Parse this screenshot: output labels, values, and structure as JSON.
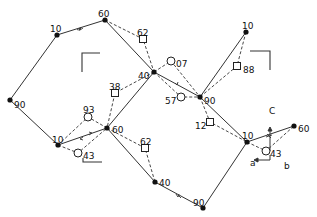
{
  "diagram": {
    "title": "",
    "nodes": [
      {
        "id": "n1",
        "label": "90",
        "x": 10,
        "y": 100,
        "lx": 14,
        "ly": 105
      },
      {
        "id": "n2",
        "label": "10",
        "x": 57,
        "y": 35,
        "lx": 50,
        "ly": 29
      },
      {
        "id": "n3",
        "label": "60",
        "x": 105,
        "y": 20,
        "lx": 98,
        "ly": 14
      },
      {
        "id": "n4",
        "label": "40",
        "x": 154,
        "y": 72,
        "lx": 138,
        "ly": 76
      },
      {
        "id": "n5",
        "label": "90",
        "x": 200,
        "y": 97,
        "lx": 204,
        "ly": 101
      },
      {
        "id": "n6",
        "label": "10",
        "x": 246,
        "y": 32,
        "lx": 242,
        "ly": 26
      },
      {
        "id": "n7",
        "label": "10",
        "x": 58,
        "y": 145,
        "lx": 52,
        "ly": 140
      },
      {
        "id": "n8",
        "label": "60",
        "x": 107,
        "y": 128,
        "lx": 112,
        "ly": 130
      },
      {
        "id": "n9",
        "label": "40",
        "x": 155,
        "y": 182,
        "lx": 159,
        "ly": 183
      },
      {
        "id": "n10",
        "label": "90",
        "x": 203,
        "y": 208,
        "lx": 193,
        "ly": 203
      },
      {
        "id": "n11",
        "label": "10",
        "x": 247,
        "y": 142,
        "lx": 242,
        "ly": 136
      },
      {
        "id": "n12",
        "label": "60",
        "x": 294,
        "y": 126,
        "lx": 298,
        "ly": 129
      }
    ],
    "squares": [
      {
        "id": "s1",
        "label": "62",
        "x": 143,
        "y": 39,
        "lx": 137,
        "ly": 33
      },
      {
        "id": "s2",
        "label": "38",
        "x": 115,
        "y": 93,
        "lx": 109,
        "ly": 87
      },
      {
        "id": "s3",
        "label": "88",
        "x": 237,
        "y": 66,
        "lx": 243,
        "ly": 70
      },
      {
        "id": "s4",
        "label": "62",
        "x": 145,
        "y": 148,
        "lx": 140,
        "ly": 142
      },
      {
        "id": "s5",
        "label": "12",
        "x": 210,
        "y": 122,
        "lx": 195,
        "ly": 126
      }
    ],
    "circles": [
      {
        "id": "c1",
        "label": "07",
        "x": 171,
        "y": 61,
        "lx": 176,
        "ly": 64
      },
      {
        "id": "c2",
        "label": "57",
        "x": 181,
        "y": 97,
        "lx": 165,
        "ly": 101
      },
      {
        "id": "c3",
        "label": "93",
        "x": 88,
        "y": 117,
        "lx": 83,
        "ly": 110
      },
      {
        "id": "c4",
        "label": "43",
        "x": 78,
        "y": 153,
        "lx": 83,
        "ly": 156
      },
      {
        "id": "c5",
        "label": "43",
        "x": 266,
        "y": 151,
        "lx": 270,
        "ly": 154
      }
    ],
    "axis_labels": [
      {
        "id": "C",
        "label": "C",
        "x": 269,
        "y": 114
      },
      {
        "id": "a",
        "label": "a",
        "x": 250,
        "y": 166
      },
      {
        "id": "b",
        "label": "b",
        "x": 284,
        "y": 169
      }
    ]
  }
}
